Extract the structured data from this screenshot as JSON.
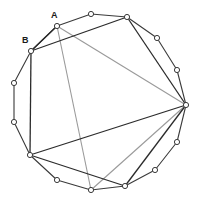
{
  "figure": {
    "type": "geometry-diagram",
    "canvas": {
      "width": 198,
      "height": 204
    },
    "colors": {
      "background": "#ffffff",
      "outline": "#3a3a3a",
      "chord_dark": "#2b2b2b",
      "chord_light": "#9a9a9a",
      "vertex_fill": "#ffffff",
      "label_text": "#1a1a1a"
    },
    "vertices": [
      {
        "id": "v0",
        "x": 91,
        "y": 14,
        "label": ""
      },
      {
        "id": "v1",
        "x": 127,
        "y": 17,
        "label": ""
      },
      {
        "id": "v2",
        "x": 157,
        "y": 38,
        "label": ""
      },
      {
        "id": "v3",
        "x": 177,
        "y": 70,
        "label": ""
      },
      {
        "id": "v4",
        "x": 186,
        "y": 105,
        "label": ""
      },
      {
        "id": "v5",
        "x": 177,
        "y": 142,
        "label": ""
      },
      {
        "id": "v6",
        "x": 155,
        "y": 170,
        "label": ""
      },
      {
        "id": "v7",
        "x": 125,
        "y": 186,
        "label": ""
      },
      {
        "id": "v8",
        "x": 91,
        "y": 190,
        "label": ""
      },
      {
        "id": "v9",
        "x": 57,
        "y": 180,
        "label": ""
      },
      {
        "id": "v10",
        "x": 30,
        "y": 155,
        "label": ""
      },
      {
        "id": "v11",
        "x": 14,
        "y": 122,
        "label": ""
      },
      {
        "id": "v12",
        "x": 14,
        "y": 83,
        "label": ""
      },
      {
        "id": "v13",
        "x": 31,
        "y": 51,
        "label": "B"
      },
      {
        "id": "v14",
        "x": 57,
        "y": 26,
        "label": "A"
      }
    ],
    "outline_path": "91,14 127,17 157,38 177,70 186,105 177,142 155,170 125,186 91,190 57,180 30,155 14,122 14,83 31,51 57,26",
    "chords_dark": [
      {
        "from": "v13",
        "to": "v14",
        "label_from": "B",
        "label_to": "A"
      },
      {
        "from": "v13",
        "to": "v1",
        "label_from": "B",
        "label_to": ""
      },
      {
        "from": "v13",
        "to": "v10",
        "label_from": "B",
        "label_to": ""
      },
      {
        "from": "v10",
        "to": "v4",
        "label_from": "",
        "label_to": ""
      },
      {
        "from": "v10",
        "to": "v7",
        "label_from": "",
        "label_to": ""
      },
      {
        "from": "v1",
        "to": "v4",
        "label_from": "",
        "label_to": ""
      },
      {
        "from": "v7",
        "to": "v4",
        "label_from": "",
        "label_to": ""
      }
    ],
    "chords_light": [
      {
        "from": "v14",
        "to": "v4",
        "label_from": "A",
        "label_to": ""
      },
      {
        "from": "v14",
        "to": "v8",
        "label_from": "A",
        "label_to": ""
      },
      {
        "from": "v4",
        "to": "v8",
        "label_from": "",
        "label_to": ""
      }
    ],
    "labels": [
      {
        "text": "A",
        "x": 51,
        "y": 18,
        "vertex": "v14"
      },
      {
        "text": "B",
        "x": 22,
        "y": 43,
        "vertex": "v13"
      }
    ],
    "vertex_radius": 2.6,
    "sides": 14
  }
}
